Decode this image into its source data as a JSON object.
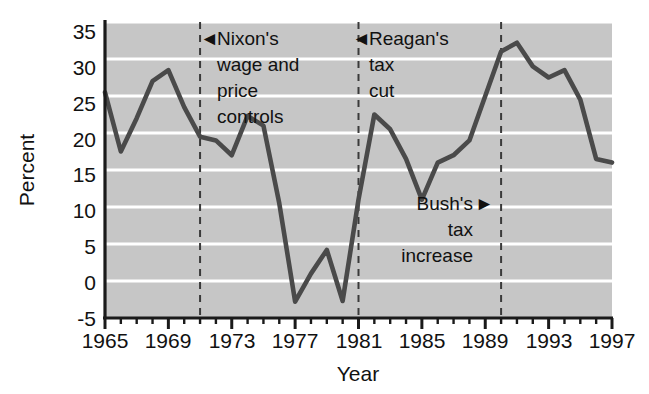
{
  "chart_data": {
    "type": "line",
    "title": "",
    "subtitle": "",
    "xlabel": "Year",
    "ylabel": "Percent",
    "xlim": [
      1965,
      1997
    ],
    "ylim": [
      -5,
      35
    ],
    "grid": "horizontal-white-gridlines-on-gray-panel",
    "legend": "none",
    "x_ticks_major": [
      "1965",
      "1969",
      "1973",
      "1977",
      "1981",
      "1985",
      "1989",
      "1993",
      "1997"
    ],
    "x_ticks_major_values": [
      1965,
      1969,
      1973,
      1977,
      1981,
      1985,
      1989,
      1993,
      1997
    ],
    "x_tick_minor_interval": 1,
    "y_ticks": [
      "35",
      "30",
      "25",
      "20",
      "15",
      "10",
      "5",
      "0",
      "-5"
    ],
    "y_tick_values": [
      35,
      30,
      25,
      20,
      15,
      10,
      5,
      0,
      -5
    ],
    "series": [
      {
        "name": "Percent",
        "color": "#4a4a4a",
        "x": [
          1965,
          1966,
          1967,
          1968,
          1969,
          1970,
          1971,
          1972,
          1973,
          1974,
          1975,
          1976,
          1977,
          1978,
          1979,
          1980,
          1981,
          1982,
          1983,
          1984,
          1985,
          1986,
          1987,
          1988,
          1989,
          1990,
          1991,
          1992,
          1993,
          1994,
          1995,
          1996,
          1997
        ],
        "values": [
          25.5,
          17.5,
          22.0,
          27.0,
          28.5,
          23.5,
          19.5,
          19.0,
          17.0,
          22.3,
          21.0,
          10.5,
          -2.8,
          1.0,
          4.2,
          -2.7,
          11.0,
          22.5,
          20.5,
          16.5,
          11.0,
          16.0,
          17.0,
          19.0,
          25.0,
          31.0,
          32.2,
          29.0,
          27.5,
          28.5,
          24.5,
          16.5,
          16.0
        ]
      }
    ],
    "annotations": [
      {
        "id": "nixon",
        "label_lines": [
          "Nixon's",
          "wage and",
          "price",
          "controls"
        ],
        "marker": "◄",
        "marker_side": "left",
        "event_year": 1971,
        "vline": true,
        "vline_style": "dashed"
      },
      {
        "id": "reagan",
        "label_lines": [
          "Reagan's",
          "tax",
          "cut"
        ],
        "marker": "◄",
        "marker_side": "left",
        "event_year": 1981,
        "vline": true,
        "vline_style": "dashed"
      },
      {
        "id": "bush",
        "label_lines": [
          "Bush's",
          "tax",
          "increase"
        ],
        "marker": "►",
        "marker_side": "right",
        "event_year": 1990,
        "vline": true,
        "vline_style": "dashed"
      }
    ],
    "colors": {
      "panel_background": "#c6c6c6",
      "gridline": "#ffffff",
      "line": "#4a4a4a",
      "axis": "#1a1a1a",
      "text": "#111111",
      "page_background": "#ffffff"
    }
  },
  "axis": {
    "y_title": "Percent",
    "x_title": "Year"
  },
  "y_labels": {
    "t0": "35",
    "t1": "30",
    "t2": "25",
    "t3": "20",
    "t4": "15",
    "t5": "10",
    "t6": "5",
    "t7": "0",
    "t8": "-5"
  },
  "x_labels": {
    "t0": "1965",
    "t1": "1969",
    "t2": "1973",
    "t3": "1977",
    "t4": "1981",
    "t5": "1985",
    "t6": "1989",
    "t7": "1993",
    "t8": "1997"
  },
  "annotations": {
    "nixon": {
      "marker": "◄",
      "line1": "Nixon's",
      "line2": "wage and",
      "line3": "price",
      "line4": "controls"
    },
    "reagan": {
      "marker": "◄",
      "line1": "Reagan's",
      "line2": "tax",
      "line3": "cut"
    },
    "bush": {
      "marker": "►",
      "line1": "Bush's",
      "line2": "tax",
      "line3": "increase"
    }
  }
}
